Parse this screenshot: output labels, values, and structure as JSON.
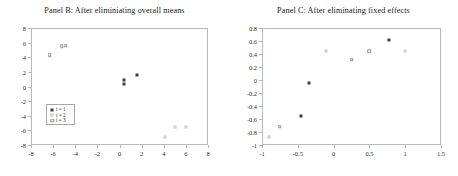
{
  "figure": {
    "panels": [
      {
        "id": "panel-b",
        "title": "Panel B: After eliminiating overall means"
      },
      {
        "id": "panel-c",
        "title": "Panel C: After eliminating fixed effects"
      }
    ]
  },
  "legend": {
    "entries": [
      {
        "label": "i = 1",
        "marker": "filled-square",
        "color": "#3d3d3d"
      },
      {
        "label": "i = 2",
        "marker": "light-dot",
        "color": "#dcdcdc"
      },
      {
        "label": "i = 3",
        "marker": "open-square",
        "color": "#9a9a9a"
      }
    ]
  },
  "chart_data": [
    {
      "type": "scatter",
      "title": "Panel B: After eliminiating overall means",
      "xlabel": "",
      "ylabel": "",
      "xlim": [
        -8,
        8
      ],
      "ylim": [
        -8,
        8
      ],
      "xticks": [
        -8,
        -6,
        -4,
        -2,
        0,
        2,
        4,
        6,
        8
      ],
      "yticks": [
        -8,
        -6,
        -4,
        -2,
        0,
        2,
        4,
        6,
        8
      ],
      "xtick_labels": [
        "-8",
        "-6",
        "-4",
        "-2",
        "0",
        "2",
        "4",
        "6",
        "8"
      ],
      "ytick_labels": [
        "-8",
        "-6",
        "-4",
        "-2",
        "0",
        "2",
        "4",
        "6",
        "8"
      ],
      "grid": false,
      "legend_position": "lower-left-inside",
      "series": [
        {
          "name": "i = 1",
          "marker": "filled-square",
          "color": "#3d3d3d",
          "points": [
            [
              0.45,
              0.9
            ],
            [
              0.45,
              0.4
            ],
            [
              1.6,
              1.55
            ]
          ]
        },
        {
          "name": "i = 2",
          "marker": "light-dot",
          "color": "#dcdcdc",
          "points": [
            [
              4.1,
              -6.85
            ],
            [
              5.0,
              -5.55
            ],
            [
              6.0,
              -5.55
            ]
          ]
        },
        {
          "name": "i = 3",
          "marker": "open-square",
          "color": "#9a9a9a",
          "points": [
            [
              -6.3,
              4.3
            ],
            [
              -5.2,
              5.5
            ],
            [
              -4.85,
              5.55
            ]
          ]
        }
      ]
    },
    {
      "type": "scatter",
      "title": "Panel C: After eliminating fixed effects",
      "xlabel": "",
      "ylabel": "",
      "xlim": [
        -1,
        1.5
      ],
      "ylim": [
        -1,
        0.8
      ],
      "xticks": [
        -1,
        -0.5,
        0,
        0.5,
        1,
        1.5
      ],
      "yticks": [
        -1,
        -0.8,
        -0.6,
        -0.4,
        -0.2,
        0,
        0.2,
        0.4,
        0.6,
        0.8
      ],
      "xtick_labels": [
        "-1",
        "-0.5",
        "0",
        "0.5",
        "1",
        "1.5"
      ],
      "ytick_labels": [
        "-1",
        "-0.8",
        "-0.6",
        "-0.4",
        "-0.2",
        "0",
        "0.2",
        "0.4",
        "0.6",
        "0.8"
      ],
      "grid": false,
      "legend_position": "right-middle-inside",
      "series": [
        {
          "name": "i = 1",
          "marker": "filled-square",
          "color": "#3d3d3d",
          "points": [
            [
              -0.45,
              -0.56
            ],
            [
              -0.35,
              -0.04
            ],
            [
              0.77,
              0.62
            ]
          ]
        },
        {
          "name": "i = 2",
          "marker": "light-dot",
          "color": "#dcdcdc",
          "points": [
            [
              -0.9,
              -0.87
            ],
            [
              -0.1,
              0.45
            ],
            [
              1.0,
              0.45
            ]
          ]
        },
        {
          "name": "i = 3",
          "marker": "open-square",
          "color": "#9a9a9a",
          "points": [
            [
              -0.75,
              -0.72
            ],
            [
              0.25,
              0.31
            ],
            [
              0.5,
              0.44
            ]
          ]
        }
      ]
    }
  ]
}
